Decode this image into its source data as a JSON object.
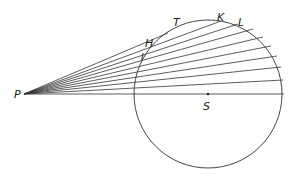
{
  "diagram": {
    "type": "geometry",
    "labels": {
      "P": "P",
      "S": "S",
      "T": "T",
      "K": "K",
      "L": "L",
      "H": "H",
      "I": "I"
    },
    "points": {
      "P": [
        24,
        94
      ],
      "S": [
        208,
        94
      ]
    },
    "circle": {
      "cx": 208,
      "cy": 94,
      "r": 74,
      "stroke": "#444444"
    },
    "rays": [
      {
        "end": [
          208,
          94
        ],
        "note": "to right edge through S",
        "x2": 284,
        "y2": 94
      },
      {
        "x2": 283,
        "y2": 80
      },
      {
        "x2": 281,
        "y2": 67
      },
      {
        "x2": 277,
        "y2": 56
      },
      {
        "x2": 271,
        "y2": 46
      },
      {
        "x2": 263,
        "y2": 37
      },
      {
        "x2": 253,
        "y2": 29
      },
      {
        "x2": 238,
        "y2": 24
      },
      {
        "x2": 221,
        "y2": 21
      },
      {
        "x2": 168,
        "y2": 33,
        "note": "tangent toward T"
      }
    ],
    "colors": {
      "line": "#333333",
      "background": "#ffffff"
    }
  }
}
